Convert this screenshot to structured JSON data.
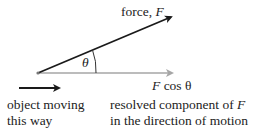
{
  "diagram": {
    "force_label": {
      "prefix": "force, ",
      "symbol": "F"
    },
    "angle_label": "θ",
    "component_label": {
      "symbol": "F",
      "rest": " cos θ"
    },
    "motion_caption": {
      "line1": "object moving",
      "line2": "this way"
    },
    "component_caption": {
      "line1_prefix": "resolved component of ",
      "line1_symbol": "F",
      "line2": "in the direction of motion"
    },
    "colors": {
      "force_arrow": "#1a1a1a",
      "component_arrow": "#a6a6a6",
      "motion_arrow": "#1a1a1a",
      "text": "#222222"
    }
  }
}
